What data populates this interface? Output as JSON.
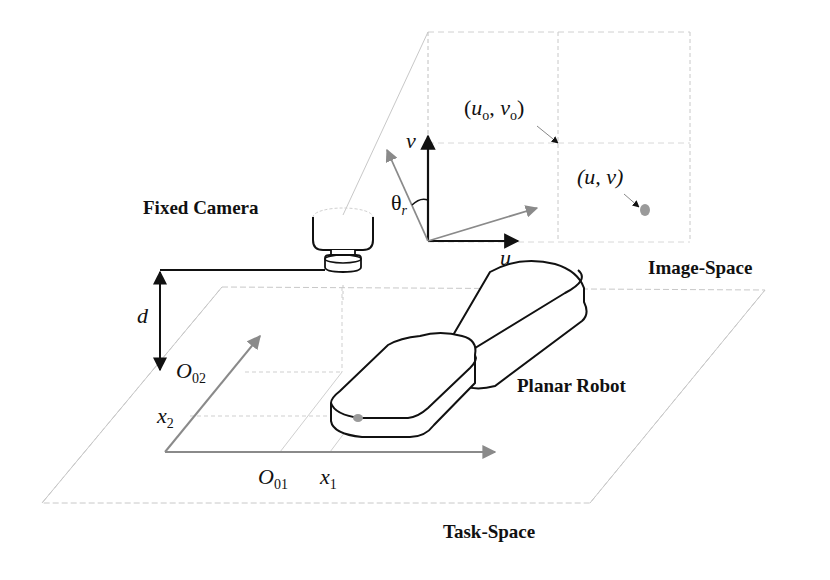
{
  "labels": {
    "fixed_camera": "Fixed Camera",
    "image_space": "Image-Space",
    "task_space": "Task-Space",
    "planar_robot": "Planar Robot",
    "distance": "d",
    "image_axis_u": "u",
    "image_axis_v": "v",
    "rotation_angle": {
      "base": "θ",
      "sub": "r"
    },
    "principal_point": {
      "open": "(",
      "u": "u",
      "u_sub": "o",
      "sep": ", ",
      "v": "v",
      "v_sub": "o",
      "close": ")"
    },
    "image_point": "(u, v)",
    "origin_02": {
      "base": "O",
      "sub": "02"
    },
    "origin_01": {
      "base": "O",
      "sub": "01"
    },
    "task_axis_x1": {
      "base": "x",
      "sub": "1"
    },
    "task_axis_x2": {
      "base": "x",
      "sub": "2"
    }
  },
  "colors": {
    "ink": "#111111",
    "gray_axis": "#8a8a8a",
    "plane_line": "#c8c8c8",
    "dot": "#9a9a9a"
  },
  "geometry": {
    "image_plane": {
      "x1": 428,
      "y1": 32,
      "x2": 690,
      "y2": 242
    },
    "task_plane": [
      [
        222,
        287
      ],
      [
        765,
        290
      ],
      [
        590,
        503
      ],
      [
        42,
        503
      ]
    ]
  }
}
